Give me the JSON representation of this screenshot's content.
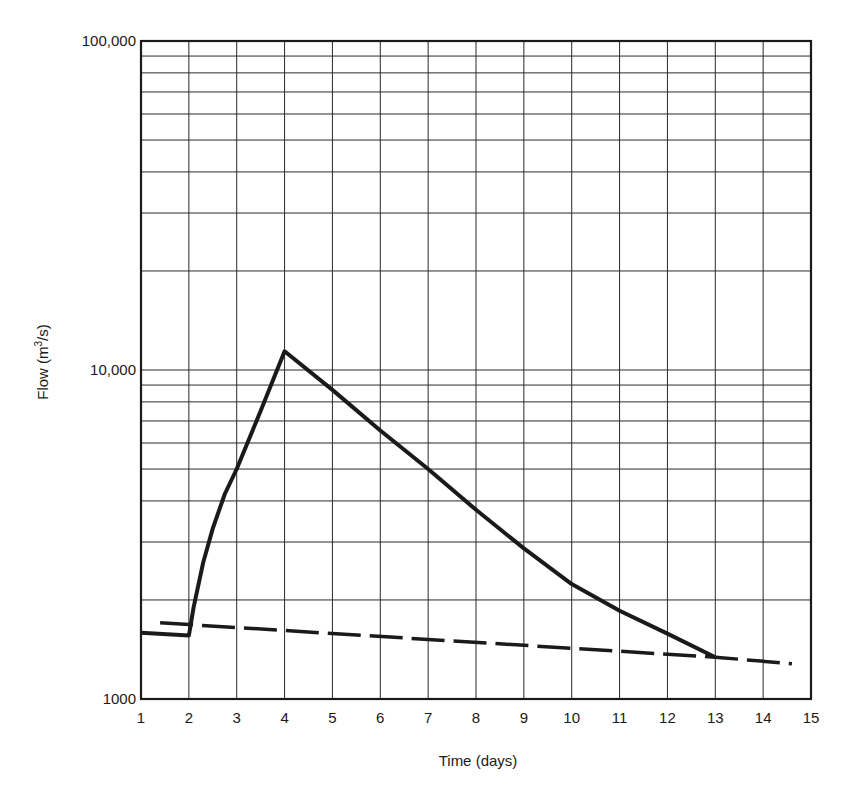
{
  "chart_data": {
    "type": "line",
    "title": "",
    "xlabel": "Time (days)",
    "ylabel": "Flow (m³/s)",
    "ylabel_parts": {
      "base": "Flow (m",
      "sup": "3",
      "tail": "/s)"
    },
    "xlim": [
      1,
      15
    ],
    "ylim": [
      1000,
      100000
    ],
    "yscale": "log",
    "grid": true,
    "x_ticks": [
      1,
      2,
      3,
      4,
      5,
      6,
      7,
      8,
      9,
      10,
      11,
      12,
      13,
      14,
      15
    ],
    "y_tick_labels": [
      {
        "value": 1000,
        "label": "1000"
      },
      {
        "value": 10000,
        "label": "10,000"
      },
      {
        "value": 100000,
        "label": "100,000"
      }
    ],
    "legend": null,
    "series": [
      {
        "name": "Streamflow hydrograph",
        "style": "solid",
        "color": "#1a1a1a",
        "points": [
          [
            1.0,
            1590
          ],
          [
            2.0,
            1560
          ],
          [
            2.1,
            1900
          ],
          [
            2.3,
            2600
          ],
          [
            2.5,
            3300
          ],
          [
            2.75,
            4200
          ],
          [
            3.0,
            5000
          ],
          [
            3.5,
            7500
          ],
          [
            4.0,
            11400
          ],
          [
            5.0,
            8700
          ],
          [
            6.0,
            6550
          ],
          [
            7.0,
            5000
          ],
          [
            8.0,
            3760
          ],
          [
            9.0,
            2870
          ],
          [
            10.0,
            2235
          ],
          [
            11.0,
            1855
          ],
          [
            12.0,
            1580
          ],
          [
            13.0,
            1340
          ]
        ]
      },
      {
        "name": "Baseflow separation",
        "style": "dashed",
        "color": "#1a1a1a",
        "points": [
          [
            1.4,
            1705
          ],
          [
            13.0,
            1340
          ],
          [
            14.6,
            1280
          ]
        ]
      }
    ]
  }
}
